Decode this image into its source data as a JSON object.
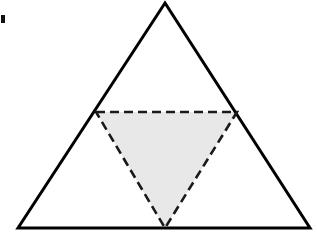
{
  "figure": {
    "canvas": {
      "width": 317,
      "height": 246,
      "background": "#ffffff"
    },
    "colors": {
      "outline": "#000000",
      "dashed_outline": "#1a1a1a",
      "shaded_fill": "#e8e8e8",
      "background": "#ffffff",
      "edge_mark": "#111111"
    },
    "outer_triangle": {
      "label": "outer-triangle",
      "stroke_style": "solid",
      "stroke_width": 3,
      "fill": "none",
      "vertices": [
        {
          "name": "apex",
          "x": 165,
          "y": 3
        },
        {
          "name": "bottom-left",
          "x": 18,
          "y": 228
        },
        {
          "name": "bottom-right",
          "x": 310,
          "y": 228
        }
      ],
      "points": "165,3 18,228 310,228"
    },
    "inner_triangle": {
      "label": "medial-triangle",
      "stroke_style": "dashed",
      "stroke_width": 2.6,
      "dash_pattern": "9,5",
      "fill": "#e8e8e8",
      "orientation": "point-down",
      "vertices": [
        {
          "name": "midpoint-left-side",
          "x": 96,
          "y": 112
        },
        {
          "name": "midpoint-right-side",
          "x": 237,
          "y": 112
        },
        {
          "name": "midpoint-base",
          "x": 165,
          "y": 228
        }
      ],
      "points": "96,112 237,112 165,228"
    },
    "edge_mark": {
      "label": "left-edge-scan-mark",
      "x": 1,
      "y": 15,
      "width": 4,
      "height": 8
    }
  }
}
